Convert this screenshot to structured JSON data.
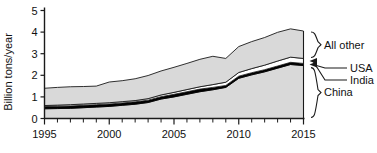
{
  "chart_data": {
    "type": "area",
    "title": "",
    "xlabel": "",
    "ylabel": "Billion tons/year",
    "xlim": [
      1995,
      2015
    ],
    "ylim": [
      0,
      5
    ],
    "ytick_labels": [
      "0",
      "1",
      "2",
      "3",
      "4",
      "5"
    ],
    "ytick_values": [
      0,
      1,
      2,
      3,
      4,
      5
    ],
    "xtick_labels": [
      "1995",
      "2000",
      "2005",
      "2010",
      "2015"
    ],
    "xtick_values": [
      1995,
      2000,
      2005,
      2010,
      2015
    ],
    "xtick_minor_step": 1,
    "grid": false,
    "stacked": true,
    "legend_position": "right-braces",
    "x": [
      1995,
      1996,
      1997,
      1998,
      1999,
      2000,
      2001,
      2002,
      2003,
      2004,
      2005,
      2006,
      2007,
      2008,
      2009,
      2010,
      2011,
      2012,
      2013,
      2014,
      2015
    ],
    "series": [
      {
        "name": "China",
        "color": "#d9d9d9",
        "legend_style": "brace",
        "values": [
          0.45,
          0.46,
          0.47,
          0.5,
          0.53,
          0.56,
          0.61,
          0.66,
          0.74,
          0.9,
          1.0,
          1.12,
          1.24,
          1.33,
          1.44,
          1.86,
          2.02,
          2.16,
          2.33,
          2.5,
          2.45
        ]
      },
      {
        "name": "USA",
        "color": "#000000",
        "legend_style": "arrow",
        "values": [
          0.1,
          0.11,
          0.11,
          0.11,
          0.11,
          0.11,
          0.11,
          0.11,
          0.11,
          0.11,
          0.12,
          0.12,
          0.12,
          0.11,
          0.09,
          0.1,
          0.1,
          0.1,
          0.1,
          0.1,
          0.1
        ]
      },
      {
        "name": "India",
        "color": "#ffffff",
        "legend_style": "arrow",
        "values": [
          0.05,
          0.05,
          0.06,
          0.06,
          0.06,
          0.06,
          0.06,
          0.06,
          0.07,
          0.08,
          0.09,
          0.1,
          0.11,
          0.13,
          0.15,
          0.17,
          0.19,
          0.21,
          0.23,
          0.24,
          0.23
        ]
      },
      {
        "name": "All other",
        "color": "#d9d9d9",
        "legend_style": "brace",
        "values": [
          0.8,
          0.82,
          0.83,
          0.81,
          0.8,
          0.96,
          0.97,
          1.01,
          1.07,
          1.11,
          1.16,
          1.21,
          1.27,
          1.31,
          1.1,
          1.2,
          1.25,
          1.28,
          1.33,
          1.31,
          1.27
        ]
      }
    ],
    "totals": [
      1.4,
      1.44,
      1.47,
      1.48,
      1.5,
      1.69,
      1.75,
      1.84,
      1.99,
      2.2,
      2.37,
      2.55,
      2.74,
      2.88,
      2.78,
      3.33,
      3.56,
      3.75,
      3.99,
      4.15,
      4.05
    ],
    "annotations": []
  },
  "legend": {
    "all_other": "All other",
    "usa": "USA",
    "india": "India",
    "china": "China"
  },
  "axis": {
    "y_title": "Billion tons/year"
  }
}
